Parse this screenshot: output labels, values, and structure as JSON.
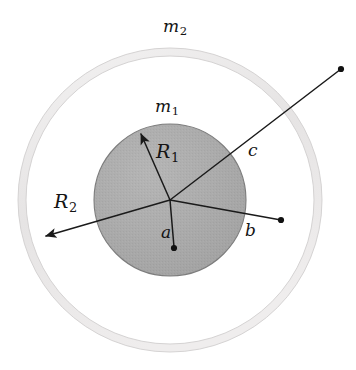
{
  "figure": {
    "background_color": "#ffffff",
    "width": 356,
    "height": 370
  },
  "geometry": {
    "center": {
      "x": 170,
      "y": 200
    },
    "inner_sphere": {
      "name": "inner-solid-sphere",
      "radius": 76,
      "fill_color": "#a8a8a8",
      "edge_color": "#6e6e6e"
    },
    "outer_shell": {
      "name": "outer-spherical-shell",
      "outer_radius": 152,
      "inner_radius": 144,
      "fill_color": "#eceaea",
      "edge_color": "#d8d6d6"
    }
  },
  "labels": {
    "m2": {
      "base": "m",
      "sub": "2"
    },
    "m1": {
      "base": "m",
      "sub": "1"
    },
    "R1": {
      "base": "R",
      "sub": "1"
    },
    "R2": {
      "base": "R",
      "sub": "2"
    },
    "c": {
      "base": "c"
    },
    "b": {
      "base": "b"
    },
    "a": {
      "base": "a"
    }
  },
  "vectors": [
    {
      "name": "R1-radius-arrow",
      "label": "R1",
      "from": {
        "x": 170,
        "y": 200
      },
      "to": {
        "x": 139,
        "y": 130
      },
      "arrowhead": true,
      "endpoint_dot": false,
      "length_px": 76
    },
    {
      "name": "R2-radius-arrow",
      "label": "R2",
      "from": {
        "x": 170,
        "y": 200
      },
      "to": {
        "x": 41,
        "y": 238
      },
      "arrowhead": true,
      "endpoint_dot": false,
      "length_px": 152
    },
    {
      "name": "c-position-line",
      "label": "c",
      "from": {
        "x": 170,
        "y": 200
      },
      "to": {
        "x": 341,
        "y": 69
      },
      "arrowhead": false,
      "endpoint_dot": true,
      "length_px": 215
    },
    {
      "name": "b-position-line",
      "label": "b",
      "from": {
        "x": 170,
        "y": 200
      },
      "to": {
        "x": 281,
        "y": 220
      },
      "arrowhead": false,
      "endpoint_dot": true,
      "length_px": 113
    },
    {
      "name": "a-position-line",
      "label": "a",
      "from": {
        "x": 170,
        "y": 200
      },
      "to": {
        "x": 174,
        "y": 248
      },
      "arrowhead": false,
      "endpoint_dot": true,
      "length_px": 48
    }
  ],
  "colors": {
    "line": "#1a1a1a",
    "sphere_fill": "#a8a8a8",
    "shell_fill": "#ececec",
    "text": "#141414"
  }
}
